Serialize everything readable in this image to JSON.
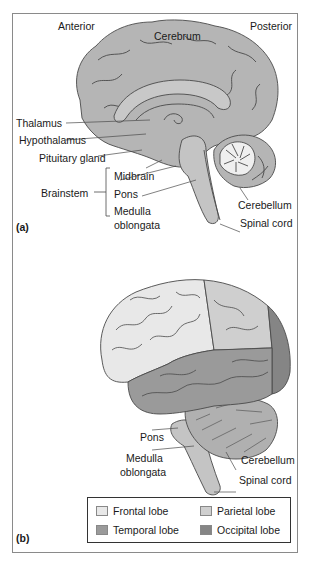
{
  "panel_a": {
    "tag": "(a)",
    "orientation": {
      "anterior": "Anterior",
      "posterior": "Posterior"
    },
    "labels": {
      "cerebrum": "Cerebrum",
      "thalamus": "Thalamus",
      "hypothalamus": "Hypothalamus",
      "pituitary_gland": "Pituitary gland",
      "brainstem": "Brainstem",
      "midbrain": "Midbrain",
      "pons": "Pons",
      "medulla_line1": "Medulla",
      "medulla_line2": "oblongata",
      "cerebellum": "Cerebellum",
      "spinal_cord": "Spinal cord"
    }
  },
  "panel_b": {
    "tag": "(b)",
    "labels": {
      "pons": "Pons",
      "medulla_line1": "Medulla",
      "medulla_line2": "oblongata",
      "cerebellum": "Cerebellum",
      "spinal_cord": "Spinal cord"
    },
    "legend": [
      {
        "label": "Frontal lobe",
        "color": "#e8e8e8"
      },
      {
        "label": "Parietal lobe",
        "color": "#cfcfcf"
      },
      {
        "label": "Temporal lobe",
        "color": "#9a9a9a"
      },
      {
        "label": "Occipital lobe",
        "color": "#858585"
      }
    ]
  },
  "colors": {
    "brain_medial": "#b5b5b5",
    "brainstem": "#c4c4c4",
    "cerebellum_white": "#efefef",
    "outline": "#4a4a4a",
    "frame": "#8a8a8a"
  }
}
